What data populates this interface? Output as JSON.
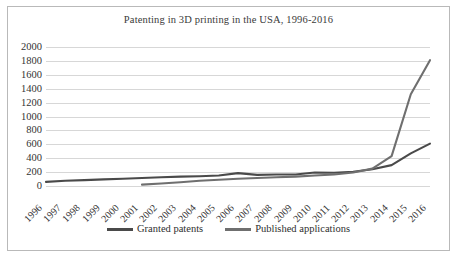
{
  "chart_data": {
    "type": "line",
    "title": "Patenting in 3D printing in the USA, 1996-2016",
    "xlabel": "",
    "ylabel": "",
    "ylim": [
      0,
      2000
    ],
    "ytick_step": 200,
    "grid": true,
    "legend_position": "bottom",
    "categories": [
      "1996",
      "1997",
      "1998",
      "1999",
      "2000",
      "2001",
      "2002",
      "2003",
      "2004",
      "2005",
      "2006",
      "2007",
      "2008",
      "2009",
      "2010",
      "2011",
      "2012",
      "2013",
      "2014",
      "2015",
      "2016"
    ],
    "yticks": [
      "0",
      "200",
      "400",
      "600",
      "800",
      "1000",
      "1200",
      "1400",
      "1600",
      "1800",
      "2000"
    ],
    "series": [
      {
        "name": "Granted patents",
        "color": "#4a4a4a",
        "values": [
          60,
          75,
          85,
          95,
          105,
          115,
          125,
          135,
          140,
          150,
          185,
          160,
          165,
          165,
          195,
          190,
          205,
          240,
          300,
          470,
          610
        ]
      },
      {
        "name": "Published applications",
        "color": "#6f6f6f",
        "values": [
          null,
          null,
          null,
          null,
          null,
          20,
          35,
          55,
          75,
          90,
          105,
          115,
          125,
          135,
          150,
          165,
          195,
          250,
          430,
          1320,
          1810
        ]
      }
    ]
  },
  "legend": {
    "entries": [
      {
        "label": "Granted patents"
      },
      {
        "label": "Published applications"
      }
    ]
  }
}
